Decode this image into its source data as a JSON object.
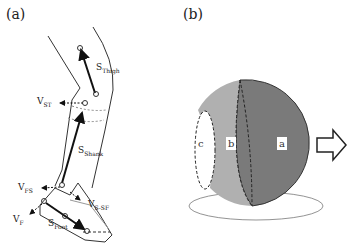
{
  "panel_a": {
    "label": "(a)",
    "vectors": {
      "s_thigh": {
        "main": "S",
        "sub": "Thigh"
      },
      "v_st": {
        "main": "V",
        "sub": "ST"
      },
      "s_shank": {
        "main": "S",
        "sub": "Shank"
      },
      "v_fs": {
        "main": "V",
        "sub": "FS"
      },
      "v_s_sf": {
        "main": "V",
        "sub": "S-SF"
      },
      "v_f": {
        "main": "V",
        "sub": "F"
      },
      "s_foot": {
        "main": "S",
        "sub": "Foot"
      }
    }
  },
  "panel_b": {
    "label": "(b)",
    "segments": {
      "a": "a",
      "b": "b",
      "c": "c"
    },
    "colors": {
      "a": "#7a7a7a",
      "b": "#b0b0b0",
      "c": "#ffffff"
    }
  }
}
